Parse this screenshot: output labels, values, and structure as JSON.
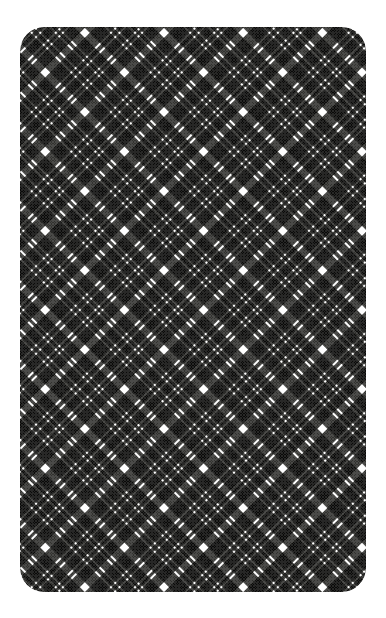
{
  "canvas": {
    "width": 386,
    "height": 618,
    "background_color": "#ffffff"
  },
  "card": {
    "name": "plaid-pattern-card",
    "left": 20,
    "top": 27,
    "width": 346,
    "height": 565,
    "corner_radius": 24,
    "fill_color": "#ffffff"
  },
  "pattern": {
    "title": "Diagonal Tartan Plaid",
    "style": "black-and-white bias plaid",
    "orientation_degrees": 45,
    "repeat_px": 56,
    "dark_color": "#32322f",
    "light_color": "#ffffff",
    "directions": [
      "warp-45deg",
      "weft-minus-45deg"
    ],
    "blend_mode": "multiply",
    "stripe_sequence": [
      {
        "start": 0,
        "end": 7,
        "color": "#ffffff",
        "role": "thick-white-guide-line"
      },
      {
        "start": 7,
        "end": 21,
        "color": "#32322f",
        "role": "dark-block"
      },
      {
        "start": 21,
        "end": 23,
        "color": "#ffffff",
        "role": "thin-white-line"
      },
      {
        "start": 23,
        "end": 27,
        "color": "#32322f",
        "role": "dark-bar"
      },
      {
        "start": 27,
        "end": 29,
        "color": "#ffffff",
        "role": "thin-white-line"
      },
      {
        "start": 29,
        "end": 38,
        "color": "#32322f",
        "role": "dark-block"
      },
      {
        "start": 38,
        "end": 40,
        "color": "#ffffff",
        "role": "thin-white-line"
      },
      {
        "start": 40,
        "end": 43,
        "color": "#32322f",
        "role": "dark-bar"
      },
      {
        "start": 43,
        "end": 45,
        "color": "#ffffff",
        "role": "thin-white-line"
      },
      {
        "start": 45,
        "end": 56,
        "color": "#32322f",
        "role": "dark-block"
      }
    ],
    "texture_opacity": 0.12
  }
}
